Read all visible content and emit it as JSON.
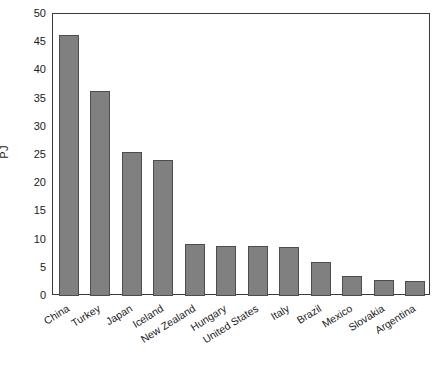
{
  "chart_data": {
    "type": "bar",
    "title": "",
    "xlabel": "",
    "ylabel": "PJ",
    "categories": [
      "China",
      "Turkey",
      "Japan",
      "Iceland",
      "New Zealand",
      "Hungary",
      "United States",
      "Italy",
      "Brazil",
      "Mexico",
      "Slovakia",
      "Argentina"
    ],
    "values": [
      46.3,
      36.3,
      25.5,
      24.2,
      9.3,
      8.9,
      8.8,
      8.6,
      6.1,
      3.6,
      2.8,
      2.7
    ],
    "ylim": [
      0,
      50
    ],
    "yticks": [
      0,
      5,
      10,
      15,
      20,
      25,
      30,
      35,
      40,
      45,
      50
    ],
    "ytick_labels": [
      "0",
      "5",
      "10",
      "15",
      "20",
      "25",
      "30",
      "35",
      "40",
      "45",
      "50"
    ],
    "grid": false,
    "legend": null,
    "bar_color": "#808080",
    "bar_edge_color": "#4d4d4d",
    "axis_color": "#3a3a3a",
    "background": "#ffffff"
  },
  "figure": {
    "caption_fragment": ""
  }
}
